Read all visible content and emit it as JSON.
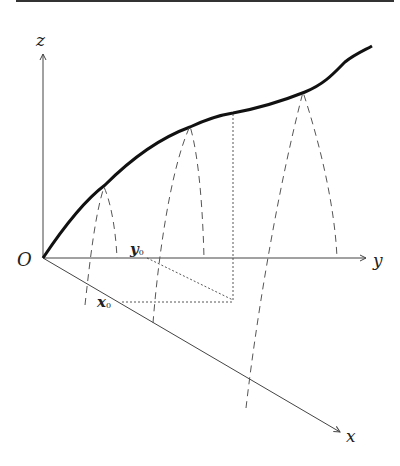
{
  "diagram": {
    "type": "3d-coordinate-figure",
    "axes": {
      "origin_label": "O",
      "x_label": "x",
      "y_label": "y",
      "z_label": "z"
    },
    "point_labels": {
      "x0_main": "x",
      "x0_sub": "0",
      "y0_main": "y",
      "y0_sub": "0"
    },
    "colors": {
      "curve": "#111111",
      "axis": "#444444",
      "dashed": "#555555"
    }
  }
}
